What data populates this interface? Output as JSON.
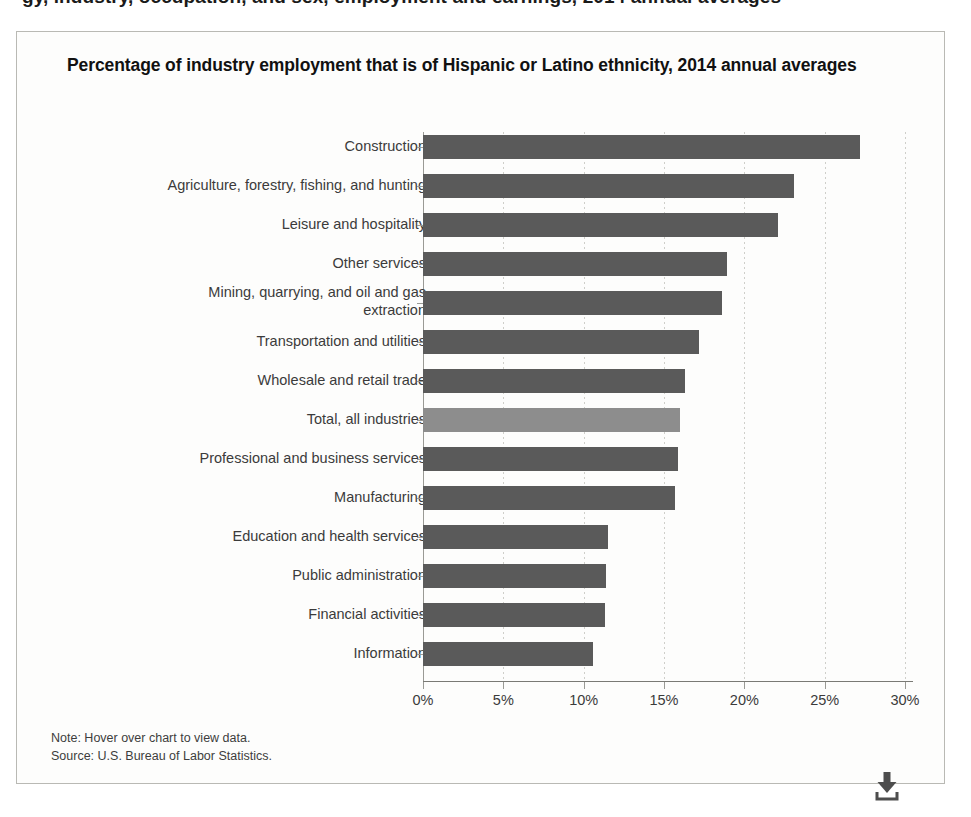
{
  "top_crop_text": "gy, industry, occupation, and sex, employment and earnings, 2014 annual averages",
  "chart": {
    "title": "Percentage of industry employment that is of Hispanic or Latino ethnicity, 2014 annual averages",
    "note": "Note: Hover over chart to view data.",
    "source": "Source: U.S. Bureau of Labor Statistics.",
    "download_icon": "download-icon",
    "bar_color": "#5a5a5a",
    "highlight_color": "#8d8d8d"
  },
  "chart_data": {
    "type": "bar",
    "orientation": "horizontal",
    "title": "Percentage of industry employment that is of Hispanic or Latino ethnicity, 2014 annual averages",
    "xlabel": "",
    "ylabel": "",
    "xlim": [
      0,
      30
    ],
    "xticks": [
      0,
      5,
      10,
      15,
      20,
      25,
      30
    ],
    "xtick_labels": [
      "0%",
      "5%",
      "10%",
      "15%",
      "20%",
      "25%",
      "30%"
    ],
    "grid": true,
    "legend": false,
    "units": "percent",
    "categories": [
      "Construction",
      "Agriculture, forestry, fishing, and hunting",
      "Leisure and hospitality",
      "Other services",
      "Mining, quarrying, and oil and gas\nextraction",
      "Transportation and utilities",
      "Wholesale and retail trade",
      "Total, all industries",
      "Professional and business services",
      "Manufacturing",
      "Education and health services",
      "Public administration",
      "Financial activities",
      "Information"
    ],
    "values": [
      27.2,
      23.1,
      22.1,
      18.9,
      18.6,
      17.2,
      16.3,
      16.0,
      15.9,
      15.7,
      11.5,
      11.4,
      11.3,
      10.6
    ],
    "highlight_index": 7
  }
}
